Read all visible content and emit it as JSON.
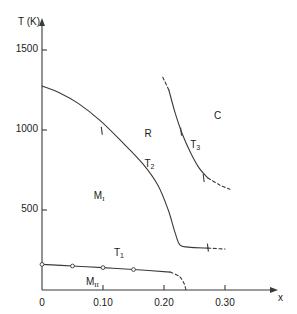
{
  "figure": {
    "kind": "phase-diagram",
    "background": "#ffffff",
    "ink_color": "#3a3a3a",
    "text_color": "#1a1a1a"
  },
  "axes": {
    "y": {
      "title": "T (K)",
      "tick_labels": [
        "1500",
        "1000",
        "500"
      ],
      "tick_values": [
        1500,
        1000,
        500
      ],
      "range": [
        0,
        1700
      ],
      "arrow": true
    },
    "x": {
      "title": "x",
      "tick_labels": [
        "0",
        "0.10",
        "0.20",
        "0.30"
      ],
      "tick_values": [
        0,
        0.1,
        0.2,
        0.3
      ],
      "range": [
        0,
        0.345
      ],
      "arrow": true
    }
  },
  "regions": [
    {
      "name": "M_I",
      "text": "M",
      "subscript": "I",
      "x": 0.085,
      "y": 620
    },
    {
      "name": "M_II",
      "text": "M",
      "subscript": "II",
      "x": 0.072,
      "y": 80
    },
    {
      "name": "R",
      "text": "R",
      "subscript": "",
      "x": 0.168,
      "y": 1005
    },
    {
      "name": "C",
      "text": "C",
      "subscript": "",
      "x": 0.282,
      "y": 1120
    }
  ],
  "curve_labels": [
    {
      "name": "T1",
      "text": "T",
      "subscript": "1",
      "x": 0.118,
      "y": 260
    },
    {
      "name": "T2",
      "text": "T",
      "subscript": "2",
      "x": 0.168,
      "y": 820
    },
    {
      "name": "T3",
      "text": "T",
      "subscript": "3",
      "x": 0.243,
      "y": 940
    }
  ],
  "chart_data": {
    "type": "line",
    "title": "",
    "xlabel": "x",
    "ylabel": "T (K)",
    "xlim": [
      0,
      0.345
    ],
    "ylim": [
      0,
      1700
    ],
    "grid": false,
    "legend": null,
    "xticks": [
      0,
      0.1,
      0.2,
      0.3
    ],
    "xticklabels": [
      "0",
      "0.10",
      "0.20",
      "0.30"
    ],
    "yticks": [
      500,
      1000,
      1500
    ],
    "yticklabels": [
      "500",
      "1000",
      "1500"
    ],
    "series": [
      {
        "name": "T1",
        "label": "T1",
        "style": "solid-with-dashed-tail",
        "markers": "open-circle",
        "points": [
          {
            "x": 0.0,
            "y": 160
          },
          {
            "x": 0.05,
            "y": 150
          },
          {
            "x": 0.1,
            "y": 140
          },
          {
            "x": 0.15,
            "y": 128
          },
          {
            "x": 0.21,
            "y": 112
          }
        ],
        "marker_points": [
          {
            "x": 0.0,
            "y": 160
          },
          {
            "x": 0.05,
            "y": 150
          },
          {
            "x": 0.1,
            "y": 140
          },
          {
            "x": 0.15,
            "y": 128
          }
        ],
        "dashed_tail": [
          {
            "x": 0.21,
            "y": 112
          },
          {
            "x": 0.225,
            "y": 85
          },
          {
            "x": 0.233,
            "y": 40
          },
          {
            "x": 0.236,
            "y": 0
          }
        ]
      },
      {
        "name": "T2",
        "label": "T2",
        "style": "solid-with-dashed-tail",
        "tick_marks": [
          {
            "x": 0.098,
            "y": 995
          },
          {
            "x": 0.272,
            "y": 265
          }
        ],
        "points": [
          {
            "x": 0.0,
            "y": 1275
          },
          {
            "x": 0.03,
            "y": 1230
          },
          {
            "x": 0.06,
            "y": 1165
          },
          {
            "x": 0.095,
            "y": 1060
          },
          {
            "x": 0.13,
            "y": 930
          },
          {
            "x": 0.165,
            "y": 790
          },
          {
            "x": 0.19,
            "y": 655
          },
          {
            "x": 0.207,
            "y": 500
          },
          {
            "x": 0.218,
            "y": 360
          },
          {
            "x": 0.226,
            "y": 282
          },
          {
            "x": 0.24,
            "y": 268
          },
          {
            "x": 0.272,
            "y": 262
          }
        ],
        "dashed_tail": [
          {
            "x": 0.272,
            "y": 262
          },
          {
            "x": 0.3,
            "y": 256
          }
        ]
      },
      {
        "name": "T3",
        "label": "T3",
        "style": "dashed-solid-dashed",
        "tick_marks": [
          {
            "x": 0.228,
            "y": 990
          },
          {
            "x": 0.265,
            "y": 700
          }
        ],
        "dashed_head": [
          {
            "x": 0.198,
            "y": 1330
          },
          {
            "x": 0.208,
            "y": 1250
          }
        ],
        "points": [
          {
            "x": 0.208,
            "y": 1250
          },
          {
            "x": 0.218,
            "y": 1110
          },
          {
            "x": 0.23,
            "y": 975
          },
          {
            "x": 0.244,
            "y": 855
          },
          {
            "x": 0.258,
            "y": 760
          },
          {
            "x": 0.272,
            "y": 700
          }
        ],
        "dashed_tail": [
          {
            "x": 0.272,
            "y": 700
          },
          {
            "x": 0.292,
            "y": 655
          },
          {
            "x": 0.308,
            "y": 630
          }
        ]
      }
    ]
  }
}
